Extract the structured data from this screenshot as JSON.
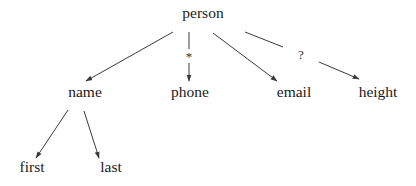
{
  "diagram": {
    "type": "tree",
    "colors": {
      "background": "#ffffff",
      "text": "#1a1a1a",
      "edge": "#3a3a3a"
    },
    "nodes": {
      "person": "person",
      "name": "name",
      "phone": "phone",
      "email": "email",
      "height": "height",
      "first": "first",
      "last": "last"
    },
    "edges": [
      {
        "from": "person",
        "to": "name",
        "label": ""
      },
      {
        "from": "person",
        "to": "phone",
        "label": "*"
      },
      {
        "from": "person",
        "to": "email",
        "label": ""
      },
      {
        "from": "person",
        "to": "height",
        "label": "?"
      },
      {
        "from": "name",
        "to": "first",
        "label": ""
      },
      {
        "from": "name",
        "to": "last",
        "label": ""
      }
    ],
    "edge_labels": {
      "phone": "*",
      "height": "?"
    }
  }
}
